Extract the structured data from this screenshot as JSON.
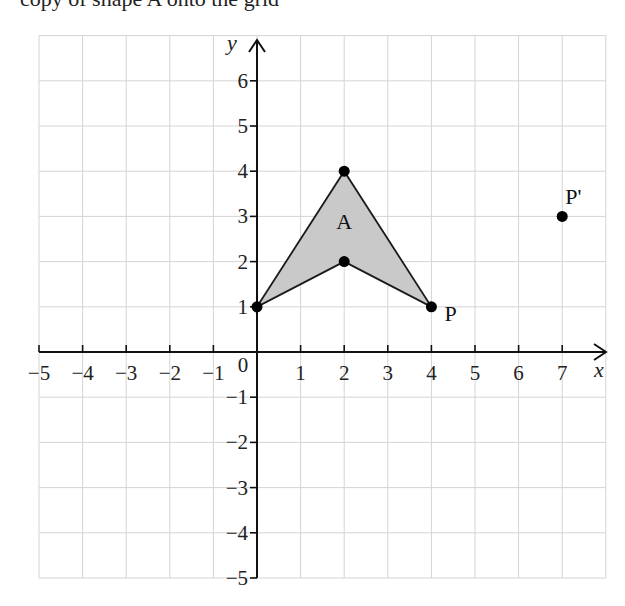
{
  "header": {
    "partial_text": "copy of shape A onto the grid"
  },
  "chart_data": {
    "type": "scatter",
    "title": "",
    "xlabel": "x",
    "ylabel": "y",
    "xlim": [
      -5,
      8
    ],
    "ylim": [
      -5,
      7
    ],
    "grid": true,
    "x_ticks": [
      -5,
      -4,
      -3,
      -2,
      -1,
      0,
      1,
      2,
      3,
      4,
      5,
      6,
      7
    ],
    "y_ticks": [
      -5,
      -4,
      -3,
      -2,
      -1,
      1,
      2,
      3,
      4,
      5,
      6
    ],
    "x_tick_labels": [
      "−5",
      "−4",
      "−3",
      "−2",
      "−1",
      "0",
      "1",
      "2",
      "3",
      "4",
      "5",
      "6",
      "7"
    ],
    "y_tick_labels": [
      "−5",
      "−4",
      "−3",
      "−2",
      "−1",
      "1",
      "2",
      "3",
      "4",
      "5",
      "6"
    ],
    "shapes": [
      {
        "name": "A",
        "vertices": [
          [
            0,
            1
          ],
          [
            2,
            4
          ],
          [
            4,
            1
          ],
          [
            2,
            2
          ]
        ],
        "fill": "#c9c9c9",
        "stroke": "#1a1a1a",
        "label_position": [
          2,
          2.9
        ]
      }
    ],
    "points": [
      {
        "label": "",
        "x": 0,
        "y": 1
      },
      {
        "label": "",
        "x": 2,
        "y": 4
      },
      {
        "label": "",
        "x": 2,
        "y": 2
      },
      {
        "label": "P",
        "x": 4,
        "y": 1
      },
      {
        "label": "P'",
        "x": 7,
        "y": 3
      }
    ]
  },
  "layout": {
    "origin_px": [
      257,
      352
    ],
    "unit_x_px": 43.6,
    "unit_y_px": 45.2,
    "grid_color": "#d4d4d4",
    "axis_color": "#111111"
  }
}
